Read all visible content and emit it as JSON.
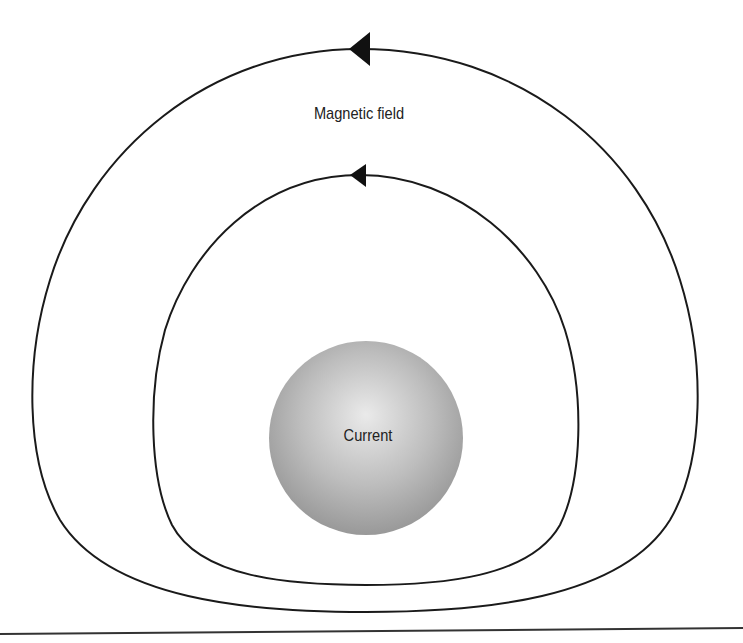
{
  "diagram": {
    "labels": {
      "field": "Magnetic field",
      "current": "Current"
    },
    "conductor": {
      "shape": "sphere",
      "center": [
        366,
        438
      ],
      "radius": 97,
      "highlight_color": "#e6e6e6",
      "shade_color": "#9a9a9a"
    },
    "field_lines": [
      {
        "name": "outer",
        "direction": "counterclockwise",
        "arrow_at": "top"
      },
      {
        "name": "inner",
        "direction": "counterclockwise",
        "arrow_at": "top"
      }
    ],
    "colors": {
      "line": "#1a1a1a",
      "background": "#ffffff"
    }
  }
}
